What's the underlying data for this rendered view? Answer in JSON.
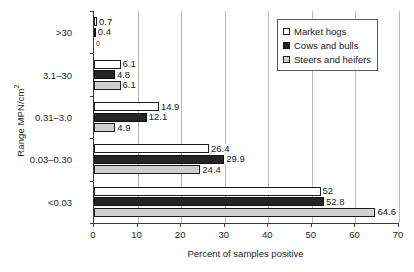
{
  "chart_data": {
    "type": "bar",
    "orientation": "horizontal",
    "title": "",
    "xlabel": "Percent of samples positive",
    "ylabel": "Range MPN/cm2",
    "ylabel_display": "Range MPN/cm",
    "ylabel_superscript": "2",
    "categories": [
      "<0.03",
      "0.03–0.30",
      "0.31–3.0",
      "3.1–30",
      ">30"
    ],
    "series": [
      {
        "name": "Market hogs",
        "color": "#ffffff",
        "values": [
          52,
          26.4,
          14.9,
          6.1,
          0.7
        ],
        "labels": [
          "52",
          "26.4",
          "14.9",
          "6.1",
          "0.7"
        ]
      },
      {
        "name": "Cows and bulls",
        "color": "#242424",
        "values": [
          52.8,
          29.9,
          12.1,
          4.8,
          0.4
        ],
        "labels": [
          "52.8",
          "29.9",
          "12.1",
          "4.8",
          "0.4"
        ]
      },
      {
        "name": "Steers and heifers",
        "color": "#d0d0d0",
        "values": [
          64.6,
          24.4,
          4.9,
          6.1,
          0
        ],
        "labels": [
          "64.6",
          "24.4",
          "4.9",
          "6.1",
          "0"
        ]
      }
    ],
    "xlim": [
      0,
      70
    ],
    "xticks": [
      0,
      10,
      20,
      30,
      40,
      50,
      60,
      70
    ],
    "xtick_labels": [
      "0",
      "10",
      "20",
      "30",
      "40",
      "50",
      "60",
      "70"
    ],
    "grid": "vertical",
    "legend_position": "top-right",
    "legend_entries": [
      "Market hogs",
      "Cows and bulls",
      "Steers and heifers"
    ]
  }
}
